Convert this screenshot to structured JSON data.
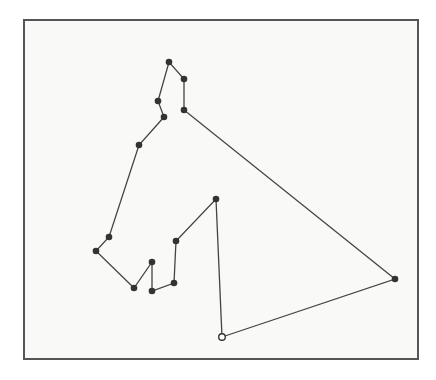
{
  "diagram": {
    "type": "closed-tour",
    "frame": {
      "x": 23,
      "y": 19,
      "width": 394,
      "height": 339,
      "border_color": "#555555",
      "background": "#f9f9f8"
    },
    "line_color": "#444444",
    "node_color": "#333333",
    "start_node": {
      "x": 222,
      "y": 337,
      "style": "open-circle"
    },
    "nodes": [
      {
        "x": 222,
        "y": 337
      },
      {
        "x": 395,
        "y": 279
      },
      {
        "x": 184,
        "y": 110
      },
      {
        "x": 184,
        "y": 79
      },
      {
        "x": 169,
        "y": 62
      },
      {
        "x": 158,
        "y": 101
      },
      {
        "x": 164,
        "y": 117
      },
      {
        "x": 139,
        "y": 145
      },
      {
        "x": 109,
        "y": 237
      },
      {
        "x": 96,
        "y": 251
      },
      {
        "x": 134,
        "y": 288
      },
      {
        "x": 152,
        "y": 262
      },
      {
        "x": 152,
        "y": 291
      },
      {
        "x": 174,
        "y": 283
      },
      {
        "x": 176,
        "y": 241
      },
      {
        "x": 216,
        "y": 199
      }
    ]
  }
}
